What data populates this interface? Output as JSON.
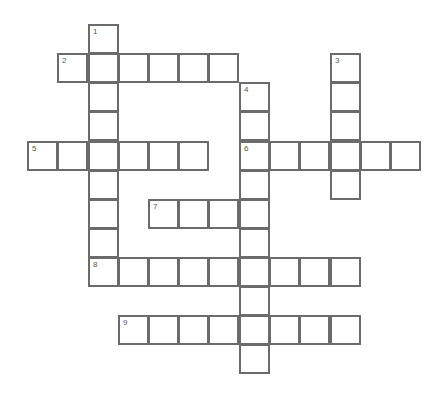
{
  "puzzle": {
    "type": "crossword",
    "cell_size": 30,
    "col_x": [
      27,
      57,
      88,
      118,
      148,
      178,
      208,
      239,
      269,
      299,
      330,
      360,
      390
    ],
    "row_y": [
      24,
      53,
      82,
      111,
      141,
      170,
      199,
      228,
      257,
      286,
      315,
      344
    ],
    "entries": [
      {
        "number": "1",
        "direction": "down",
        "row": 0,
        "col": 2,
        "length": 9
      },
      {
        "number": "2",
        "direction": "across",
        "row": 1,
        "col": 1,
        "length": 6
      },
      {
        "number": "3",
        "direction": "down",
        "row": 1,
        "col": 10,
        "length": 5
      },
      {
        "number": "4",
        "direction": "down",
        "row": 2,
        "col": 7,
        "length": 10
      },
      {
        "number": "5",
        "direction": "across",
        "row": 4,
        "col": 0,
        "length": 6
      },
      {
        "number": "6",
        "direction": "across",
        "row": 4,
        "col": 7,
        "length": 6
      },
      {
        "number": "7",
        "direction": "across",
        "row": 6,
        "col": 4,
        "length": 4
      },
      {
        "number": "8",
        "direction": "across",
        "row": 8,
        "col": 2,
        "length": 9
      },
      {
        "number": "9",
        "direction": "across",
        "row": 10,
        "col": 3,
        "length": 8
      }
    ]
  },
  "colors": {
    "background": "#ffffff",
    "cell_border": "#6b6b6b",
    "number_text": "#555555"
  }
}
